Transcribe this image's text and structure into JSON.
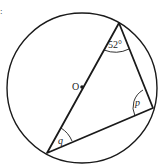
{
  "diagram": {
    "type": "circle-geometry",
    "center_label": "O",
    "angles": [
      {
        "vertex": "top",
        "label": "52°"
      },
      {
        "vertex": "right",
        "label": "p"
      },
      {
        "vertex": "bottom-left",
        "label": "q"
      }
    ],
    "corner_mark": ":",
    "colors": {
      "stroke": "#1a1a1a",
      "background": "#ffffff"
    }
  }
}
